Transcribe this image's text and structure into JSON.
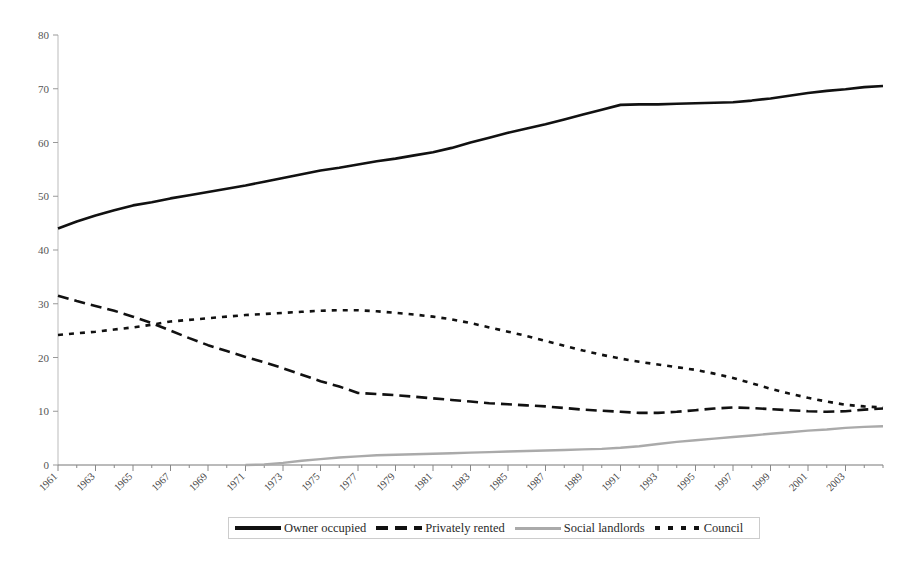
{
  "chart_data": {
    "type": "line",
    "title": "",
    "subtitle": "",
    "xlabel": "",
    "ylabel": "",
    "xlim": [
      1961,
      2005
    ],
    "ylim": [
      0,
      80
    ],
    "yticks": [
      0,
      10,
      20,
      30,
      40,
      50,
      60,
      70,
      80
    ],
    "grid": false,
    "legend_position": "bottom-center",
    "x": [
      1961,
      1962,
      1963,
      1964,
      1965,
      1966,
      1967,
      1968,
      1969,
      1970,
      1971,
      1972,
      1973,
      1974,
      1975,
      1976,
      1977,
      1978,
      1979,
      1980,
      1981,
      1982,
      1983,
      1984,
      1985,
      1986,
      1987,
      1988,
      1989,
      1990,
      1991,
      1992,
      1993,
      1994,
      1995,
      1996,
      1997,
      1998,
      1999,
      2000,
      2001,
      2002,
      2003,
      2004,
      2005
    ],
    "xtick_labels": [
      "1961",
      "1963",
      "1965",
      "1967",
      "1969",
      "1971",
      "1973",
      "1975",
      "1977",
      "1979",
      "1981",
      "1983",
      "1985",
      "1987",
      "1989",
      "1991",
      "1993",
      "1995",
      "1997",
      "1999",
      "2001",
      "2003"
    ],
    "series": [
      {
        "name": "Owner occupied",
        "style": "solid",
        "color": "#111111",
        "values": [
          44.0,
          45.3,
          46.4,
          47.4,
          48.3,
          48.9,
          49.6,
          50.2,
          50.8,
          51.4,
          52.0,
          52.7,
          53.4,
          54.1,
          54.8,
          55.3,
          55.9,
          56.5,
          57.0,
          57.6,
          58.2,
          59.0,
          60.0,
          60.9,
          61.8,
          62.6,
          63.4,
          64.3,
          65.2,
          66.1,
          67.0,
          67.1,
          67.1,
          67.2,
          67.3,
          67.4,
          67.5,
          67.8,
          68.2,
          68.7,
          69.2,
          69.6,
          69.9,
          70.3,
          70.5
        ]
      },
      {
        "name": "Privately rented",
        "style": "long-dash",
        "color": "#111111",
        "values": [
          31.5,
          30.5,
          29.6,
          28.7,
          27.6,
          26.4,
          25.0,
          23.6,
          22.3,
          21.2,
          20.1,
          19.1,
          18.0,
          16.8,
          15.6,
          14.6,
          13.4,
          13.2,
          13.0,
          12.7,
          12.4,
          12.1,
          11.8,
          11.5,
          11.3,
          11.1,
          10.9,
          10.6,
          10.3,
          10.1,
          9.9,
          9.7,
          9.7,
          9.9,
          10.2,
          10.5,
          10.7,
          10.6,
          10.4,
          10.2,
          10.0,
          9.9,
          10.0,
          10.3,
          10.5
        ]
      },
      {
        "name": "Social landlords",
        "style": "solid",
        "color": "#aaaaaa",
        "values": [
          0,
          0,
          0,
          0,
          0,
          0,
          0,
          0,
          0,
          0,
          0,
          0.1,
          0.4,
          0.8,
          1.1,
          1.4,
          1.6,
          1.8,
          1.9,
          2.0,
          2.1,
          2.2,
          2.3,
          2.4,
          2.5,
          2.6,
          2.7,
          2.8,
          2.9,
          3.0,
          3.2,
          3.5,
          3.9,
          4.3,
          4.6,
          4.9,
          5.2,
          5.5,
          5.8,
          6.1,
          6.4,
          6.6,
          6.9,
          7.1,
          7.2
        ]
      },
      {
        "name": "Council",
        "style": "short-dash",
        "color": "#111111",
        "values": [
          24.2,
          24.5,
          24.8,
          25.2,
          25.6,
          26.1,
          26.7,
          27.0,
          27.3,
          27.6,
          27.9,
          28.1,
          28.3,
          28.5,
          28.7,
          28.8,
          28.8,
          28.6,
          28.3,
          28.0,
          27.6,
          27.1,
          26.4,
          25.6,
          24.8,
          24.0,
          23.1,
          22.2,
          21.3,
          20.5,
          19.8,
          19.2,
          18.7,
          18.2,
          17.7,
          17.0,
          16.2,
          15.2,
          14.2,
          13.3,
          12.5,
          11.8,
          11.2,
          10.9,
          10.7
        ]
      }
    ]
  },
  "legend": {
    "items": [
      {
        "label": "Owner occupied",
        "swatch": "solid-black-line-swatch"
      },
      {
        "label": "Privately rented",
        "swatch": "long-dash-black-line-swatch"
      },
      {
        "label": "Social landlords",
        "swatch": "solid-gray-line-swatch"
      },
      {
        "label": "Council",
        "swatch": "short-dash-black-line-swatch"
      }
    ]
  },
  "axes": {
    "y_labels": [
      "80",
      "70",
      "60",
      "50",
      "40",
      "30",
      "20",
      "10",
      "0"
    ],
    "x_labels": [
      "1961",
      "1963",
      "1965",
      "1967",
      "1969",
      "1971",
      "1973",
      "1975",
      "1977",
      "1979",
      "1981",
      "1983",
      "1985",
      "1987",
      "1989",
      "1991",
      "1993",
      "1995",
      "1997",
      "1999",
      "2001",
      "2003"
    ]
  }
}
